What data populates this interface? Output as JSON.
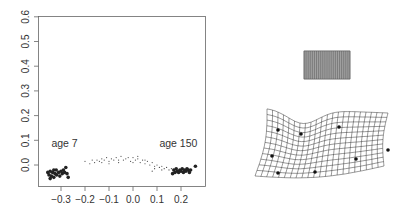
{
  "chart_data": [
    {
      "type": "scatter",
      "title": "",
      "xlabel": "",
      "ylabel": "",
      "xlim": [
        -0.37,
        0.29
      ],
      "ylim": [
        -0.07,
        0.6
      ],
      "x_ticks": [
        -0.3,
        -0.2,
        -0.1,
        0.0,
        0.1,
        0.2
      ],
      "x_tick_labels": [
        "-0.3",
        "-0.2",
        "-0.1",
        "0.0",
        "0.1",
        "0.2"
      ],
      "y_ticks": [
        0.0,
        0.1,
        0.2,
        0.3,
        0.4,
        0.5,
        0.6
      ],
      "y_tick_labels": [
        "0.0",
        "0.1",
        "0.2",
        "0.3",
        "0.4",
        "0.5",
        "0.6"
      ],
      "grid": false,
      "legend": null,
      "annotations": [
        {
          "text": "age 7",
          "x": -0.34,
          "y": 0.09
        },
        {
          "text": "age 150",
          "x": 0.11,
          "y": 0.09
        }
      ],
      "series": [
        {
          "name": "age 7 cluster (large points)",
          "marker": "filled-circle-large",
          "points": [
            [
              -0.355,
              -0.03
            ],
            [
              -0.35,
              -0.04
            ],
            [
              -0.345,
              -0.025
            ],
            [
              -0.34,
              -0.045
            ],
            [
              -0.335,
              -0.03
            ],
            [
              -0.33,
              -0.05
            ],
            [
              -0.325,
              -0.035
            ],
            [
              -0.32,
              -0.02
            ],
            [
              -0.318,
              -0.04
            ],
            [
              -0.31,
              -0.03
            ],
            [
              -0.305,
              -0.045
            ],
            [
              -0.3,
              -0.025
            ],
            [
              -0.295,
              -0.035
            ],
            [
              -0.29,
              -0.02
            ],
            [
              -0.285,
              -0.03
            ],
            [
              -0.28,
              -0.01
            ],
            [
              -0.275,
              -0.035
            ],
            [
              -0.27,
              -0.05
            ],
            [
              -0.345,
              -0.055
            ],
            [
              -0.33,
              -0.02
            ]
          ]
        },
        {
          "name": "intermediate ages (small points)",
          "marker": "small-dot",
          "points": [
            [
              -0.2,
              0.015
            ],
            [
              -0.18,
              0.005
            ],
            [
              -0.17,
              0.02
            ],
            [
              -0.16,
              0.01
            ],
            [
              -0.15,
              0.02
            ],
            [
              -0.14,
              0.015
            ],
            [
              -0.13,
              0.025
            ],
            [
              -0.12,
              0.02
            ],
            [
              -0.11,
              0.03
            ],
            [
              -0.1,
              0.015
            ],
            [
              -0.09,
              0.025
            ],
            [
              -0.08,
              0.02
            ],
            [
              -0.07,
              0.03
            ],
            [
              -0.06,
              0.01
            ],
            [
              -0.05,
              0.035
            ],
            [
              -0.04,
              0.02
            ],
            [
              -0.03,
              0.025
            ],
            [
              -0.02,
              0.03
            ],
            [
              -0.01,
              0.015
            ],
            [
              0.0,
              0.03
            ],
            [
              0.01,
              0.02
            ],
            [
              0.02,
              0.025
            ],
            [
              0.03,
              0.01
            ],
            [
              0.04,
              0.02
            ],
            [
              0.05,
              0.005
            ],
            [
              0.06,
              0.015
            ],
            [
              0.07,
              0.0
            ],
            [
              0.08,
              0.01
            ],
            [
              0.09,
              -0.005
            ],
            [
              0.1,
              0.0
            ],
            [
              0.11,
              -0.01
            ],
            [
              0.12,
              -0.005
            ],
            [
              0.13,
              -0.015
            ],
            [
              0.14,
              -0.01
            ],
            [
              0.15,
              -0.02
            ],
            [
              -0.13,
              0.01
            ],
            [
              -0.06,
              0.02
            ],
            [
              0.0,
              0.01
            ],
            [
              0.05,
              0.02
            ],
            [
              0.09,
              -0.015
            ],
            [
              0.12,
              -0.02
            ],
            [
              0.16,
              -0.015
            ],
            [
              0.08,
              -0.025
            ],
            [
              -0.1,
              0.005
            ],
            [
              0.02,
              0.035
            ]
          ]
        },
        {
          "name": "age 150 cluster (large points)",
          "marker": "filled-circle-large",
          "points": [
            [
              0.17,
              -0.02
            ],
            [
              0.175,
              -0.03
            ],
            [
              0.18,
              -0.015
            ],
            [
              0.185,
              -0.025
            ],
            [
              0.19,
              -0.03
            ],
            [
              0.195,
              -0.02
            ],
            [
              0.2,
              -0.025
            ],
            [
              0.205,
              -0.015
            ],
            [
              0.21,
              -0.03
            ],
            [
              0.215,
              -0.02
            ],
            [
              0.22,
              -0.025
            ],
            [
              0.225,
              -0.015
            ],
            [
              0.23,
              -0.02
            ],
            [
              0.235,
              -0.03
            ],
            [
              0.24,
              -0.02
            ],
            [
              0.165,
              -0.035
            ],
            [
              0.26,
              -0.005
            ]
          ]
        }
      ]
    },
    {
      "type": "diagram",
      "title": "",
      "description": "Thin-plate spline deformation grids",
      "panels": [
        {
          "name": "reference grid",
          "rows": 14,
          "cols": 22,
          "shape": "rectangle"
        },
        {
          "name": "deformed grid",
          "rows": 12,
          "cols": 22,
          "landmarks": 8
        }
      ]
    }
  ]
}
